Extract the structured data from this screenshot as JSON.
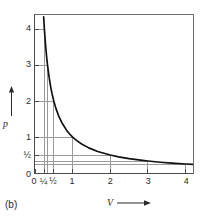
{
  "figure": {
    "panel_label": "(b)"
  },
  "chart_data": {
    "type": "line",
    "title": "",
    "subtitle": "",
    "xlabel": "V",
    "ylabel": "p",
    "xlim": [
      0,
      4.2
    ],
    "ylim": [
      0,
      4.4
    ],
    "grid": true,
    "legend": null,
    "curve_equation": "p = 1 / V",
    "x_ticks": [
      {
        "value": 0,
        "label": "0"
      },
      {
        "value": 0.25,
        "label": "¼"
      },
      {
        "value": 0.5,
        "label": "½"
      },
      {
        "value": 1,
        "label": "1"
      },
      {
        "value": 2,
        "label": "2"
      },
      {
        "value": 3,
        "label": "3"
      },
      {
        "value": 4,
        "label": "4"
      }
    ],
    "y_ticks": [
      {
        "value": 0,
        "label": "0"
      },
      {
        "value": 0.5,
        "label": "½"
      },
      {
        "value": 1,
        "label": "1"
      },
      {
        "value": 2,
        "label": "2"
      },
      {
        "value": 3,
        "label": "3"
      },
      {
        "value": 4,
        "label": "4"
      }
    ],
    "series": [
      {
        "name": "pV = 1",
        "x": [
          0.23,
          0.25,
          0.28,
          0.3125,
          0.3333,
          0.375,
          0.4167,
          0.45,
          0.5,
          0.5556,
          0.625,
          0.7143,
          0.8333,
          0.9091,
          1.0,
          1.1111,
          1.25,
          1.4286,
          1.6667,
          2.0,
          2.2222,
          2.5,
          2.8571,
          3.0,
          3.3333,
          3.6364,
          4.0,
          4.2
        ],
        "y": [
          4.348,
          4.0,
          3.571,
          3.2,
          3.0,
          2.667,
          2.4,
          2.222,
          2.0,
          1.8,
          1.6,
          1.4,
          1.2,
          1.1,
          1.0,
          0.9,
          0.8,
          0.7,
          0.6,
          0.5,
          0.45,
          0.4,
          0.35,
          0.3333,
          0.3,
          0.275,
          0.25,
          0.238
        ]
      }
    ],
    "guide_points": [
      {
        "x": 0.25,
        "y": 4
      },
      {
        "x": 0.3333,
        "y": 3
      },
      {
        "x": 0.5,
        "y": 2
      },
      {
        "x": 1,
        "y": 1
      },
      {
        "x": 2,
        "y": 0.5
      },
      {
        "x": 3,
        "y": 0.3333
      },
      {
        "x": 4,
        "y": 0.25
      }
    ],
    "colors": {
      "curve": "#111111",
      "grid": "#9a9a9a",
      "axis": "#4a4a4a",
      "frame": "#6e6e6e",
      "text": "#2b2b2b",
      "background": "#ffffff"
    }
  }
}
